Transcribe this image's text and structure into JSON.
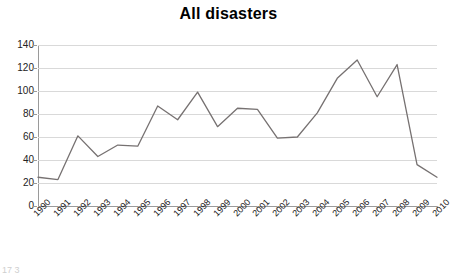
{
  "chart_data": {
    "type": "line",
    "title": "All disasters",
    "xlabel": "",
    "ylabel": "",
    "categories": [
      "1990",
      "1991",
      "1992",
      "1993",
      "1994",
      "1995",
      "1996",
      "1997",
      "1998",
      "1999",
      "2000",
      "2001",
      "2002",
      "2003",
      "2004",
      "2005",
      "2006",
      "2007",
      "2008",
      "2009",
      "2010"
    ],
    "values": [
      25,
      23,
      61,
      43,
      53,
      52,
      87,
      75,
      99,
      69,
      85,
      84,
      59,
      60,
      81,
      111,
      127,
      95,
      123,
      36,
      25
    ],
    "series": [
      {
        "name": "All disasters",
        "values": [
          25,
          23,
          61,
          43,
          53,
          52,
          87,
          75,
          99,
          69,
          85,
          84,
          59,
          60,
          81,
          111,
          127,
          95,
          123,
          36,
          25
        ]
      }
    ],
    "ylim": [
      0,
      140
    ],
    "ytick_labels": [
      "0",
      "20",
      "40",
      "60",
      "80",
      "100",
      "120",
      "140"
    ],
    "ytick_values": [
      0,
      20,
      40,
      60,
      80,
      100,
      120,
      140
    ],
    "grid": true,
    "grid_axis": "y",
    "legend": false,
    "legend_position": "none",
    "line_color": "#767171",
    "grid_color": "#d9d9d9",
    "axis_color": "#9a9a9a",
    "background": "#ffffff"
  },
  "footer": {
    "clipped_text": "17 3"
  }
}
